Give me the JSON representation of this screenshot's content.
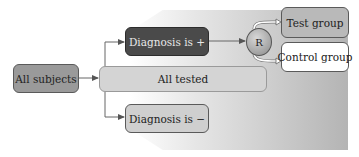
{
  "diagram": {
    "nodes": {
      "all_subjects": "All subjects",
      "all_tested": "All tested",
      "diagnosis_positive": "Diagnosis is +",
      "diagnosis_negative": "Diagnosis is −",
      "randomization": "R",
      "test_group": "Test group",
      "control_group": "Control group"
    },
    "edges": [
      {
        "from": "All subjects",
        "to": "All tested"
      },
      {
        "from": "All tested",
        "to": "Diagnosis is +"
      },
      {
        "from": "All tested",
        "to": "Diagnosis is −"
      },
      {
        "from": "Diagnosis is +",
        "to": "R"
      },
      {
        "from": "R",
        "to": "Test group"
      },
      {
        "from": "R",
        "to": "Control group"
      }
    ],
    "colors": {
      "all_subjects": "#9a9a9a",
      "all_tested": "#d4d4d4",
      "diagnosis_positive": "#4a4a4a",
      "diagnosis_negative": "#cfcfcf",
      "test_group": "#b9b9b9",
      "control_group": "#ffffff"
    }
  }
}
